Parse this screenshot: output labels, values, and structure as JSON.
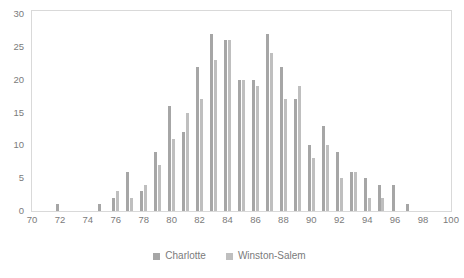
{
  "chart_data": {
    "type": "bar",
    "title": "",
    "subtitle": "",
    "xlabel": "",
    "ylabel": "",
    "xlim": [
      70,
      100
    ],
    "ylim": [
      0,
      30
    ],
    "ytick_interval": 5,
    "xtick_interval": 2,
    "grid": false,
    "legend_position": "bottom",
    "x_ticks": [
      "70",
      "72",
      "74",
      "76",
      "78",
      "80",
      "82",
      "84",
      "86",
      "88",
      "90",
      "92",
      "94",
      "96",
      "98",
      "100"
    ],
    "y_ticks": [
      "0",
      "5",
      "10",
      "15",
      "20",
      "25",
      "30"
    ],
    "categories": [
      72,
      75,
      76,
      77,
      78,
      79,
      80,
      81,
      82,
      83,
      84,
      85,
      86,
      87,
      88,
      89,
      90,
      91,
      92,
      93,
      94,
      95,
      96,
      97
    ],
    "series": [
      {
        "name": "Charlotte",
        "color": "#a6a6a6",
        "values": [
          1,
          1,
          2,
          6,
          3,
          9,
          16,
          12,
          22,
          27,
          26,
          20,
          20,
          27,
          22,
          17,
          10,
          13,
          9,
          6,
          5,
          4,
          4,
          1
        ]
      },
      {
        "name": "Winston-Salem",
        "color": "#bfbfbf",
        "values": [
          0,
          0,
          3,
          2,
          4,
          7,
          11,
          15,
          17,
          23,
          26,
          20,
          19,
          24,
          17,
          19,
          8,
          10,
          5,
          6,
          2,
          2,
          0,
          0
        ]
      }
    ],
    "points": [
      {
        "x": 72,
        "charlotte": 1,
        "winston_salem": 0
      },
      {
        "x": 75,
        "charlotte": 1,
        "winston_salem": 0
      },
      {
        "x": 76,
        "charlotte": 2,
        "winston_salem": 3
      },
      {
        "x": 77,
        "charlotte": 6,
        "winston_salem": 2
      },
      {
        "x": 78,
        "charlotte": 3,
        "winston_salem": 4
      },
      {
        "x": 79,
        "charlotte": 9,
        "winston_salem": 7
      },
      {
        "x": 80,
        "charlotte": 16,
        "winston_salem": 11
      },
      {
        "x": 81,
        "charlotte": 12,
        "winston_salem": 15
      },
      {
        "x": 82,
        "charlotte": 22,
        "winston_salem": 17
      },
      {
        "x": 83,
        "charlotte": 27,
        "winston_salem": 23
      },
      {
        "x": 84,
        "charlotte": 26,
        "winston_salem": 26
      },
      {
        "x": 85,
        "charlotte": 20,
        "winston_salem": 20
      },
      {
        "x": 86,
        "charlotte": 20,
        "winston_salem": 19
      },
      {
        "x": 87,
        "charlotte": 27,
        "winston_salem": 24
      },
      {
        "x": 88,
        "charlotte": 22,
        "winston_salem": 17
      },
      {
        "x": 89,
        "charlotte": 17,
        "winston_salem": 19
      },
      {
        "x": 90,
        "charlotte": 10,
        "winston_salem": 8
      },
      {
        "x": 91,
        "charlotte": 13,
        "winston_salem": 10
      },
      {
        "x": 92,
        "charlotte": 9,
        "winston_salem": 5
      },
      {
        "x": 93,
        "charlotte": 6,
        "winston_salem": 6
      },
      {
        "x": 94,
        "charlotte": 5,
        "winston_salem": 2
      },
      {
        "x": 95,
        "charlotte": 4,
        "winston_salem": 2
      },
      {
        "x": 96,
        "charlotte": 4,
        "winston_salem": 0
      },
      {
        "x": 97,
        "charlotte": 1,
        "winston_salem": 0
      }
    ]
  },
  "legend": {
    "items": [
      {
        "label": "Charlotte",
        "color": "#a6a6a6"
      },
      {
        "label": "Winston-Salem",
        "color": "#bfbfbf"
      }
    ]
  },
  "colors": {
    "series_1": "#a6a6a6",
    "series_2": "#bfbfbf",
    "axis_text": "#7b7b7b",
    "plot_border": "#d9d9d9",
    "background": "#ffffff"
  }
}
